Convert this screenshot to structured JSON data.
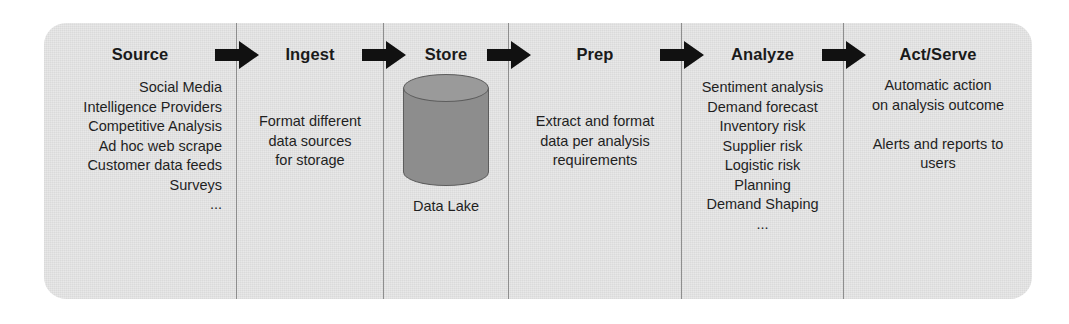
{
  "diagram": {
    "panel_color": "#e8e8e8",
    "divider_color": "#8e8e8e",
    "arrow_color": "#111111",
    "text_color": "#1f1f1f",
    "stages": [
      {
        "id": "source",
        "title": "Source",
        "align": "right",
        "lines": [
          "Social Media",
          "Intelligence Providers",
          "Competitive Analysis",
          "Ad hoc web scrape",
          "Customer data feeds",
          "Surveys",
          "..."
        ]
      },
      {
        "id": "ingest",
        "title": "Ingest",
        "align": "center",
        "lines": [
          "Format different",
          "data sources",
          "for storage"
        ]
      },
      {
        "id": "store",
        "title": "Store",
        "align": "center",
        "lines": [],
        "shape": {
          "type": "cylinder",
          "label": "Data Lake",
          "body_color": "#8d8d8d",
          "top_color": "#9a9a9a",
          "outline_color": "#5d5d5d"
        }
      },
      {
        "id": "prep",
        "title": "Prep",
        "align": "center",
        "lines": [
          "Extract and format",
          "data per analysis",
          "requirements"
        ]
      },
      {
        "id": "analyze",
        "title": "Analyze",
        "align": "center",
        "lines": [
          "Sentiment analysis",
          "Demand forecast",
          "Inventory risk",
          "Supplier risk",
          "Logistic risk",
          "Planning",
          "Demand Shaping",
          "..."
        ]
      },
      {
        "id": "act-serve",
        "title": "Act/Serve",
        "align": "center",
        "lines": [
          "Automatic action",
          "on analysis outcome",
          "",
          "Alerts and reports to",
          "users"
        ]
      }
    ],
    "arrows": [
      {
        "id": "arrow-source-to-ingest",
        "label": "flow arrow Source to Ingest"
      },
      {
        "id": "arrow-ingest-to-store",
        "label": "flow arrow Ingest to Store"
      },
      {
        "id": "arrow-store-to-prep",
        "label": "flow arrow Store to Prep"
      },
      {
        "id": "arrow-prep-to-analyze",
        "label": "flow arrow Prep to Analyze"
      },
      {
        "id": "arrow-analyze-to-act",
        "label": "flow arrow Analyze to Act/Serve"
      }
    ]
  }
}
